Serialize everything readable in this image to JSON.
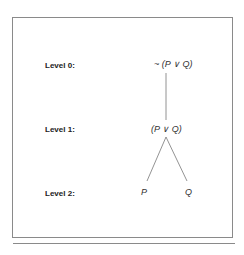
{
  "diagram": {
    "levels": [
      {
        "label": "Level 0:",
        "node": "~ (P ∨ Q)"
      },
      {
        "label": "Level 1:",
        "node": "(P ∨ Q)"
      },
      {
        "label": "Level 2:",
        "nodes": [
          "P",
          "Q"
        ]
      }
    ],
    "edges": [
      {
        "from": "~ (P ∨ Q)",
        "to": "(P ∨ Q)"
      },
      {
        "from": "(P ∨ Q)",
        "to": "P"
      },
      {
        "from": "(P ∨ Q)",
        "to": "Q"
      }
    ]
  }
}
